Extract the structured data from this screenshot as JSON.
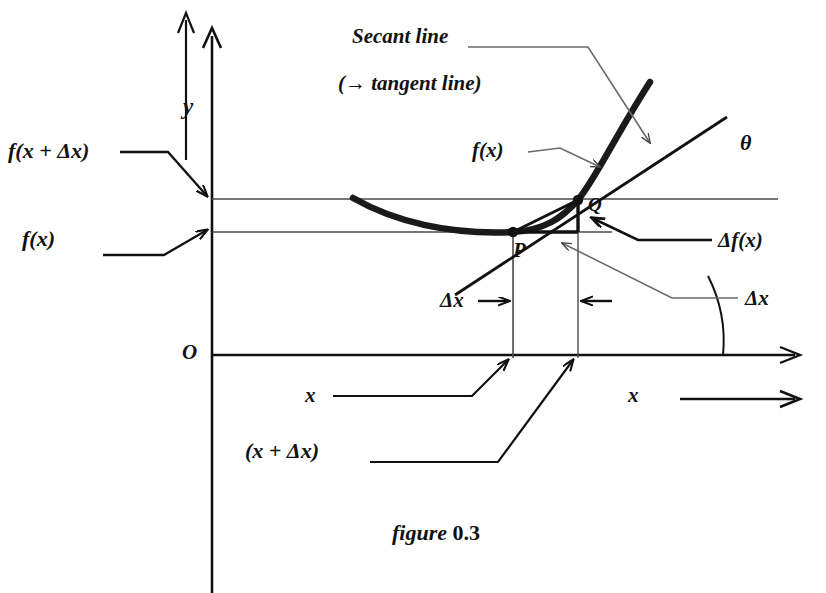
{
  "figure": {
    "caption_word": "figure",
    "caption_number": "0.3",
    "title_secant": "Secant line",
    "title_tangent": "(→ tangent line)"
  },
  "axes": {
    "origin_label": "O",
    "y_axis_label": "y",
    "x_axis_label": "x",
    "x_direction_label": "x",
    "x_direction_arrow": "→"
  },
  "labels": {
    "f_x_plus_dx": "f(x + Δx)",
    "f_x_left": "f(x)",
    "f_x_curve": "f(x)",
    "delta_f_x": "Δf(x)",
    "delta_x_right": "Δx",
    "delta_x_middle": "Δx",
    "delta_x_middle_arrow": "→",
    "delta_x_left_arrow": "←",
    "theta": "θ",
    "point_p": "P",
    "point_q": "Q",
    "x_tick": "x",
    "x_plus_dx_tick": "(x + Δx)"
  },
  "colors": {
    "ink": "#111111",
    "thin_line": "#4a4a4a",
    "paper": "#ffffff"
  },
  "geometry": {
    "origin": [
      212,
      355
    ],
    "point_p": [
      513,
      232
    ],
    "point_q": [
      578,
      200
    ],
    "upper_level_y": 199,
    "lower_level_y": 232,
    "theta_degrees": 26
  }
}
